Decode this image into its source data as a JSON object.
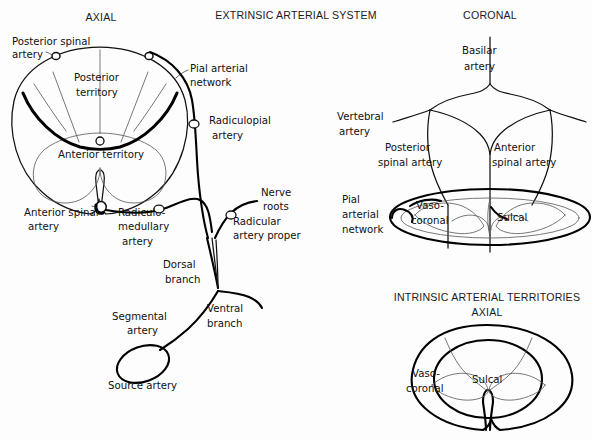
{
  "figure": {
    "main_title": "EXTRINSIC ARTERIAL SYSTEM",
    "panels": {
      "axial_left": {
        "title": "AXIAL"
      },
      "coronal": {
        "title": "CORONAL"
      },
      "intrinsic": {
        "title": "INTRINSIC ARTERIAL TERRITORIES",
        "subtitle": "AXIAL"
      }
    }
  },
  "axial_labels": {
    "posterior_spinal_artery": "Posterior spinal\nartery",
    "posterior_spinal_artery_l1": "Posterior spinal",
    "posterior_spinal_artery_l2": "artery",
    "posterior_territory_l1": "Posterior",
    "posterior_territory_l2": "territory",
    "anterior_territory": "Anterior territory",
    "pial_arterial_network_l1": "Pial arterial",
    "pial_arterial_network_l2": "network",
    "radiculopial_artery_l1": "Radiculopial",
    "radiculopial_artery_l2": "artery",
    "anterior_spinal_artery_l1": "Anterior spinal",
    "anterior_spinal_artery_l2": "artery",
    "radiculomedullary_artery_l1": "Radiculo-",
    "radiculomedullary_artery_l2": "medullary",
    "radiculomedullary_artery_l3": "artery",
    "nerve_roots_l1": "Nerve",
    "nerve_roots_l2": "roots",
    "radicular_artery_proper_l1": "Radicular",
    "radicular_artery_proper_l2": "artery proper",
    "dorsal_branch_l1": "Dorsal",
    "dorsal_branch_l2": "branch",
    "ventral_branch_l1": "Ventral",
    "ventral_branch_l2": "branch",
    "segmental_artery_l1": "Segmental",
    "segmental_artery_l2": "artery",
    "source_artery": "Source artery"
  },
  "coronal_labels": {
    "basilar_artery_l1": "Basilar",
    "basilar_artery_l2": "artery",
    "vertebral_artery_l1": "Vertebral",
    "vertebral_artery_l2": "artery",
    "posterior_spinal_artery_l1": "Posterior",
    "posterior_spinal_artery_l2": "spinal artery",
    "anterior_spinal_artery_l1": "Anterior",
    "anterior_spinal_artery_l2": "spinal artery",
    "pial_arterial_network_l1": "Pial",
    "pial_arterial_network_l2": "arterial",
    "pial_arterial_network_l3": "network",
    "vasocoronal_l1": "Vaso-",
    "vasocoronal_l2": "coronal",
    "sulcal": "Sulcal"
  },
  "intrinsic_labels": {
    "vasocoronal_l1": "Vaso-",
    "vasocoronal_l2": "coronal",
    "sulcal": "Sulcal"
  },
  "colors": {
    "background": "#fdfdfd",
    "ink": "#111111",
    "ink_light": "#555555"
  }
}
